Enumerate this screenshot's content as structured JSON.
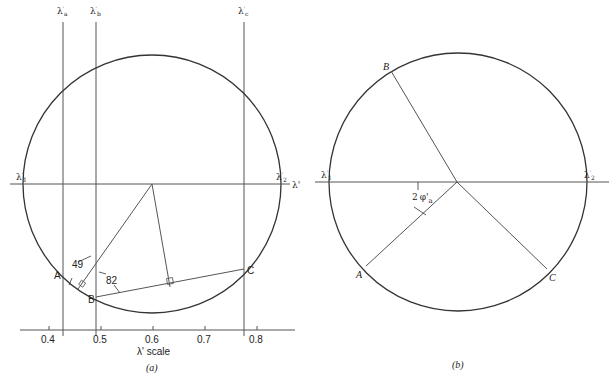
{
  "figure_a": {
    "caption": "(a)",
    "vertical_lines": [
      {
        "label": "λ'a",
        "base": "λ",
        "sub": "a",
        "x_value": 0.43
      },
      {
        "label": "λ'b",
        "base": "λ",
        "sub": "b",
        "x_value": 0.49
      },
      {
        "label": "λ'c",
        "base": "λ",
        "sub": "c",
        "x_value": 0.775
      }
    ],
    "horizontal_axis_labels": {
      "left": "λ'1",
      "left_base": "λ",
      "left_sub": "1",
      "right": "λ'2",
      "right_base": "λ",
      "right_sub": "2",
      "axis": "λ'"
    },
    "points": {
      "A": "A",
      "B": "B",
      "C": "C"
    },
    "angle_labels": {
      "angle1": "49",
      "angle2": "82"
    },
    "scale": {
      "label": "λ' scale",
      "ticks": [
        "0.4",
        "0.5",
        "0.6",
        "0.7",
        "0.8"
      ]
    }
  },
  "figure_b": {
    "caption": "(b)",
    "horizontal_axis_labels": {
      "left": "λ'1",
      "left_base": "λ",
      "left_sub": "1",
      "right": "λ'2",
      "right_base": "λ",
      "right_sub": "2"
    },
    "points": {
      "A": "A",
      "B": "B",
      "C": "C"
    },
    "angle_label": {
      "prefix": "2",
      "symbol": "φ'",
      "sub": "a"
    }
  },
  "colors": {
    "stroke": "#333333",
    "thin": "#555555",
    "text": "#222222"
  }
}
